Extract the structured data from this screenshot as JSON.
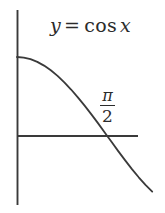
{
  "figure": {
    "background_color": "#ffffff",
    "ink_color": "#2b2b2b",
    "width": 165,
    "height": 213
  },
  "labels": {
    "equation": {
      "full_text": "y = cos x",
      "y_var": "y",
      "equals": "=",
      "function_name": "cos",
      "argument": "x"
    },
    "x_intercept": {
      "full_text": "π/2",
      "numerator": "π",
      "denominator": "2"
    }
  },
  "axes": {
    "y_axis": {
      "name": "y-axis",
      "x": 17,
      "y_top": 10,
      "y_bottom": 205
    },
    "x_axis": {
      "name": "x-axis",
      "y": 136,
      "x_left": 17,
      "x_right": 138
    }
  },
  "chart_data": {
    "type": "line",
    "xlabel": "",
    "ylabel": "",
    "grid": false,
    "legend": "none",
    "annotations": [
      {
        "text": "y = cos x",
        "kind": "equation-label",
        "px_x": 50,
        "px_y": 14
      },
      {
        "text": "π/2",
        "kind": "x-intercept-label",
        "px_x": 100,
        "px_y": 88
      }
    ],
    "axis_ticks": {
      "x": [
        "π/2"
      ],
      "y": []
    },
    "xlim": [
      0,
      2.35
    ],
    "ylim": [
      -0.73,
      1.08
    ],
    "series": [
      {
        "name": "cos x",
        "color": "#2b2b2b",
        "x": [
          0,
          0.1177,
          0.2354,
          0.3531,
          0.4708,
          0.5885,
          0.7062,
          0.8239,
          0.9416,
          1.0593,
          1.177,
          1.2947,
          1.4124,
          1.5301,
          1.5708,
          1.6478,
          1.7655,
          1.8832,
          2.0009,
          2.1186,
          2.2363,
          2.354
        ],
        "y": [
          1.0,
          0.9931,
          0.9724,
          0.9383,
          0.8913,
          0.8318,
          0.7608,
          0.6793,
          0.5884,
          0.4894,
          0.3838,
          0.2733,
          0.1595,
          0.0407,
          0.0,
          -0.077,
          -0.1943,
          -0.309,
          -0.419,
          -0.5225,
          -0.6179,
          -0.7037
        ],
        "path_px": [
          [
            17,
            57
          ],
          [
            23,
            57.6
          ],
          [
            29,
            59.4
          ],
          [
            35,
            62.4
          ],
          [
            40,
            66.5
          ],
          [
            46,
            71.7
          ],
          [
            52,
            77.8
          ],
          [
            58,
            84.9
          ],
          [
            64,
            92.8
          ],
          [
            70,
            101.4
          ],
          [
            76,
            110.6
          ],
          [
            82,
            120.2
          ],
          [
            88,
            130.1
          ],
          [
            94,
            140.5
          ],
          [
            105,
            136
          ],
          [
            100,
            142.7
          ],
          [
            106,
            152.9
          ],
          [
            112,
            163.0
          ],
          [
            118,
            172.6
          ],
          [
            124,
            181.6
          ],
          [
            130,
            189.9
          ],
          [
            136,
            197.4
          ],
          [
            152,
            200
          ]
        ]
      }
    ]
  }
}
